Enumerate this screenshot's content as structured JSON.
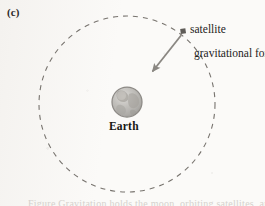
{
  "figure": {
    "panel_label": "(c)",
    "kind": "physics-diagram",
    "background_color": "#fbfaf8"
  },
  "labels": {
    "satellite": "satellite",
    "gravitational_force": "gravitational force",
    "earth": "Earth"
  },
  "caption_fragment": "Figure Gravitation holds the moon, orbiting satellites, and Earth",
  "orbit": {
    "center_x": 127,
    "center_y": 104,
    "radius": 88,
    "style": "dashed",
    "stroke_color": "#77736e",
    "stroke_width": 1.1,
    "dash_pattern": "5 5"
  },
  "earth_body": {
    "center_x": 127,
    "center_y": 102,
    "radius": 15,
    "fill_color": "#b9b7b3",
    "rim_color": "#8d8a86",
    "highlight_color": "#d7d5d1",
    "landmass_color": "#9b9892"
  },
  "satellite_marker": {
    "x": 183,
    "y": 31,
    "size": 5,
    "fill_color": "#5f5c58",
    "shape": "square"
  },
  "force_arrow": {
    "from_x": 181,
    "from_y": 35,
    "to_x": 151,
    "to_y": 73,
    "stroke_color": "#8a8782",
    "stroke_width": 1.8,
    "arrowhead": "filled-triangle",
    "points_toward": "Earth center"
  },
  "colors": {
    "ink": "#2c2a29",
    "line_gray": "#77736e",
    "arrow_gray": "#8a8782",
    "paper": "#fbfaf8"
  }
}
